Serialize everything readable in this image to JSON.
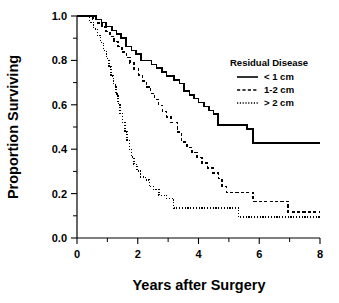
{
  "chart_data": {
    "type": "line",
    "title": "",
    "xlabel": "Years after Surgery",
    "ylabel": "Proportion Surviving",
    "xlim": [
      0,
      8
    ],
    "ylim": [
      0,
      1.0
    ],
    "grid": false,
    "xticks": [
      0,
      1,
      2,
      3,
      4,
      5,
      6,
      7,
      8
    ],
    "xtick_labels": [
      "0",
      "",
      "2",
      "",
      "4",
      "",
      "6",
      "",
      "8"
    ],
    "yticks": [
      0.0,
      0.1,
      0.2,
      0.3,
      0.4,
      0.5,
      0.6,
      0.7,
      0.8,
      0.9,
      1.0
    ],
    "ytick_labels": [
      "0.0",
      "",
      "0.2",
      "",
      "0.4",
      "",
      "0.6",
      "",
      "0.8",
      "",
      "1.0"
    ],
    "legend_position": "upper right",
    "legend_title": "Residual Disease",
    "curve_style": "step-post",
    "series": [
      {
        "name": "< 1 cm",
        "style": "solid",
        "points": [
          [
            0.0,
            1.0
          ],
          [
            0.62,
            1.0
          ],
          [
            0.62,
            0.985
          ],
          [
            0.8,
            0.985
          ],
          [
            0.8,
            0.97
          ],
          [
            0.95,
            0.97
          ],
          [
            0.95,
            0.952
          ],
          [
            1.15,
            0.952
          ],
          [
            1.15,
            0.935
          ],
          [
            1.3,
            0.935
          ],
          [
            1.3,
            0.918
          ],
          [
            1.45,
            0.918
          ],
          [
            1.45,
            0.9
          ],
          [
            1.62,
            0.9
          ],
          [
            1.62,
            0.862
          ],
          [
            1.8,
            0.862
          ],
          [
            1.8,
            0.845
          ],
          [
            1.95,
            0.845
          ],
          [
            1.95,
            0.828
          ],
          [
            2.1,
            0.828
          ],
          [
            2.1,
            0.8
          ],
          [
            2.45,
            0.8
          ],
          [
            2.45,
            0.782
          ],
          [
            2.62,
            0.782
          ],
          [
            2.62,
            0.765
          ],
          [
            2.8,
            0.765
          ],
          [
            2.8,
            0.748
          ],
          [
            2.95,
            0.748
          ],
          [
            2.95,
            0.73
          ],
          [
            3.2,
            0.73
          ],
          [
            3.2,
            0.712
          ],
          [
            3.38,
            0.712
          ],
          [
            3.38,
            0.695
          ],
          [
            3.52,
            0.695
          ],
          [
            3.52,
            0.662
          ],
          [
            3.7,
            0.662
          ],
          [
            3.7,
            0.645
          ],
          [
            3.85,
            0.645
          ],
          [
            3.85,
            0.628
          ],
          [
            4.0,
            0.628
          ],
          [
            4.0,
            0.61
          ],
          [
            4.18,
            0.61
          ],
          [
            4.18,
            0.592
          ],
          [
            4.35,
            0.592
          ],
          [
            4.35,
            0.575
          ],
          [
            4.5,
            0.575
          ],
          [
            4.5,
            0.558
          ],
          [
            4.65,
            0.558
          ],
          [
            4.65,
            0.508
          ],
          [
            5.6,
            0.508
          ],
          [
            5.6,
            0.492
          ],
          [
            5.8,
            0.492
          ],
          [
            5.8,
            0.428
          ],
          [
            8.0,
            0.428
          ]
        ]
      },
      {
        "name": "1-2 cm",
        "style": "dashed",
        "points": [
          [
            0.0,
            1.0
          ],
          [
            0.52,
            1.0
          ],
          [
            0.52,
            0.985
          ],
          [
            0.68,
            0.985
          ],
          [
            0.68,
            0.968
          ],
          [
            0.82,
            0.968
          ],
          [
            0.82,
            0.95
          ],
          [
            0.95,
            0.95
          ],
          [
            0.95,
            0.93
          ],
          [
            1.08,
            0.93
          ],
          [
            1.08,
            0.908
          ],
          [
            1.22,
            0.908
          ],
          [
            1.22,
            0.885
          ],
          [
            1.35,
            0.885
          ],
          [
            1.35,
            0.862
          ],
          [
            1.48,
            0.862
          ],
          [
            1.48,
            0.838
          ],
          [
            1.62,
            0.838
          ],
          [
            1.62,
            0.812
          ],
          [
            1.75,
            0.812
          ],
          [
            1.75,
            0.788
          ],
          [
            1.88,
            0.788
          ],
          [
            1.88,
            0.762
          ],
          [
            2.02,
            0.762
          ],
          [
            2.02,
            0.735
          ],
          [
            2.15,
            0.735
          ],
          [
            2.15,
            0.708
          ],
          [
            2.28,
            0.708
          ],
          [
            2.28,
            0.68
          ],
          [
            2.42,
            0.68
          ],
          [
            2.42,
            0.652
          ],
          [
            2.55,
            0.652
          ],
          [
            2.55,
            0.625
          ],
          [
            2.68,
            0.625
          ],
          [
            2.68,
            0.598
          ],
          [
            2.82,
            0.598
          ],
          [
            2.82,
            0.57
          ],
          [
            2.95,
            0.57
          ],
          [
            2.95,
            0.545
          ],
          [
            3.1,
            0.545
          ],
          [
            3.1,
            0.52
          ],
          [
            3.3,
            0.52
          ],
          [
            3.3,
            0.478
          ],
          [
            3.45,
            0.478
          ],
          [
            3.45,
            0.432
          ],
          [
            3.62,
            0.432
          ],
          [
            3.62,
            0.408
          ],
          [
            3.78,
            0.408
          ],
          [
            3.78,
            0.385
          ],
          [
            3.95,
            0.385
          ],
          [
            3.95,
            0.362
          ],
          [
            4.12,
            0.362
          ],
          [
            4.12,
            0.338
          ],
          [
            4.3,
            0.338
          ],
          [
            4.3,
            0.315
          ],
          [
            4.48,
            0.315
          ],
          [
            4.48,
            0.292
          ],
          [
            4.65,
            0.292
          ],
          [
            4.65,
            0.268
          ],
          [
            4.78,
            0.268
          ],
          [
            4.78,
            0.232
          ],
          [
            4.92,
            0.232
          ],
          [
            4.92,
            0.205
          ],
          [
            5.8,
            0.205
          ],
          [
            5.8,
            0.165
          ],
          [
            6.95,
            0.165
          ],
          [
            6.95,
            0.118
          ],
          [
            8.0,
            0.118
          ]
        ]
      },
      {
        "name": "> 2 cm",
        "style": "dotted",
        "points": [
          [
            0.0,
            1.0
          ],
          [
            0.42,
            1.0
          ],
          [
            0.42,
            0.972
          ],
          [
            0.55,
            0.972
          ],
          [
            0.55,
            0.942
          ],
          [
            0.68,
            0.942
          ],
          [
            0.68,
            0.912
          ],
          [
            0.78,
            0.912
          ],
          [
            0.78,
            0.88
          ],
          [
            0.88,
            0.88
          ],
          [
            0.88,
            0.845
          ],
          [
            0.98,
            0.845
          ],
          [
            0.98,
            0.808
          ],
          [
            1.05,
            0.808
          ],
          [
            1.05,
            0.77
          ],
          [
            1.12,
            0.77
          ],
          [
            1.12,
            0.73
          ],
          [
            1.2,
            0.73
          ],
          [
            1.2,
            0.69
          ],
          [
            1.28,
            0.69
          ],
          [
            1.28,
            0.648
          ],
          [
            1.35,
            0.648
          ],
          [
            1.35,
            0.605
          ],
          [
            1.42,
            0.605
          ],
          [
            1.42,
            0.562
          ],
          [
            1.5,
            0.562
          ],
          [
            1.5,
            0.52
          ],
          [
            1.58,
            0.52
          ],
          [
            1.58,
            0.478
          ],
          [
            1.65,
            0.478
          ],
          [
            1.65,
            0.438
          ],
          [
            1.72,
            0.438
          ],
          [
            1.72,
            0.4
          ],
          [
            1.8,
            0.4
          ],
          [
            1.8,
            0.365
          ],
          [
            1.88,
            0.365
          ],
          [
            1.88,
            0.332
          ],
          [
            1.98,
            0.332
          ],
          [
            1.98,
            0.302
          ],
          [
            2.1,
            0.302
          ],
          [
            2.1,
            0.275
          ],
          [
            2.25,
            0.275
          ],
          [
            2.25,
            0.262
          ],
          [
            2.38,
            0.262
          ],
          [
            2.38,
            0.232
          ],
          [
            2.52,
            0.232
          ],
          [
            2.52,
            0.218
          ],
          [
            2.7,
            0.218
          ],
          [
            2.7,
            0.192
          ],
          [
            2.95,
            0.192
          ],
          [
            2.95,
            0.178
          ],
          [
            3.18,
            0.178
          ],
          [
            3.18,
            0.135
          ],
          [
            5.32,
            0.135
          ],
          [
            5.32,
            0.095
          ],
          [
            8.0,
            0.095
          ]
        ]
      }
    ]
  }
}
